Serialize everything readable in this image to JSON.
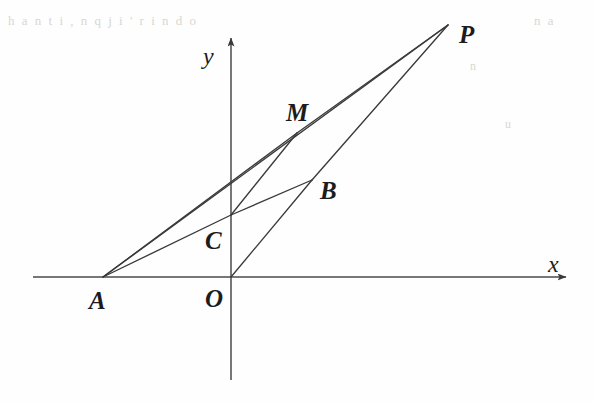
{
  "figure": {
    "kind": "plane-geometry-diagram",
    "width": 594,
    "height": 402,
    "background_color": "#fefefe",
    "ink_color": "#3a3a3a",
    "label_color": "#1c1c1c"
  },
  "axes": {
    "x_axis": {
      "label": "x",
      "label_x": 548,
      "label_y": 252,
      "start_x": 33,
      "start_y": 277,
      "end_x": 566,
      "end_y": 277,
      "arrow": "right"
    },
    "y_axis": {
      "label": "y",
      "label_x": 203,
      "label_y": 44,
      "start_x": 231,
      "start_y": 380,
      "end_x": 231,
      "end_y": 38,
      "arrow": "up"
    }
  },
  "points": [
    {
      "id": "A",
      "label": "A",
      "x": 103,
      "y": 277,
      "label_x": 89,
      "label_y": 288
    },
    {
      "id": "O",
      "label": "O",
      "x": 231,
      "y": 277,
      "label_x": 205,
      "label_y": 286
    },
    {
      "id": "C",
      "label": "C",
      "x": 231,
      "y": 215,
      "label_x": 205,
      "label_y": 228
    },
    {
      "id": "B",
      "label": "B",
      "x": 312,
      "y": 180,
      "label_x": 320,
      "label_y": 178
    },
    {
      "id": "M",
      "label": "M",
      "x": 297,
      "y": 133,
      "label_x": 286,
      "label_y": 100
    },
    {
      "id": "P",
      "label": "P",
      "x": 448,
      "y": 25,
      "label_x": 459,
      "label_y": 22
    }
  ],
  "segments": [
    {
      "id": "AP",
      "from": "A",
      "to": "P",
      "style": "solid"
    },
    {
      "id": "AM",
      "from": "A",
      "to": "M",
      "style": "solid"
    },
    {
      "id": "AC",
      "from": "A",
      "to": "C",
      "style": "solid"
    },
    {
      "id": "CB",
      "from": "C",
      "to": "B",
      "style": "solid"
    },
    {
      "id": "CM",
      "from": "C",
      "to": "M",
      "style": "solid"
    },
    {
      "id": "MP",
      "from": "M",
      "to": "P",
      "style": "solid"
    },
    {
      "id": "OB",
      "from": "O",
      "to": "B",
      "style": "solid"
    },
    {
      "id": "BP",
      "from": "B",
      "to": "P",
      "style": "solid"
    }
  ],
  "ghost_text": [
    {
      "text": "h  a  n t i , n   q  j i  ' r   i n   d o",
      "x": 8,
      "y": 14,
      "size": 13
    },
    {
      "text": "n  a",
      "x": 534,
      "y": 14,
      "size": 13
    },
    {
      "text": "n",
      "x": 470,
      "y": 60,
      "size": 12
    },
    {
      "text": "u",
      "x": 505,
      "y": 118,
      "size": 12
    }
  ]
}
